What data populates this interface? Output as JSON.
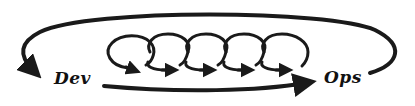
{
  "diagram": {
    "stroke_color": "#1a1a1a",
    "background": "#ffffff",
    "nodes": {
      "dev": {
        "label": "Dev"
      },
      "ops": {
        "label": "Ops"
      }
    },
    "edges": [
      {
        "from": "ops",
        "to": "dev",
        "style": "large arc over top with arrowhead"
      },
      {
        "from": "dev",
        "to": "ops",
        "style": "straight arrow along bottom"
      }
    ],
    "iteration_loops": {
      "count": 5,
      "style": "small overlapping loops with arrowheads"
    }
  }
}
